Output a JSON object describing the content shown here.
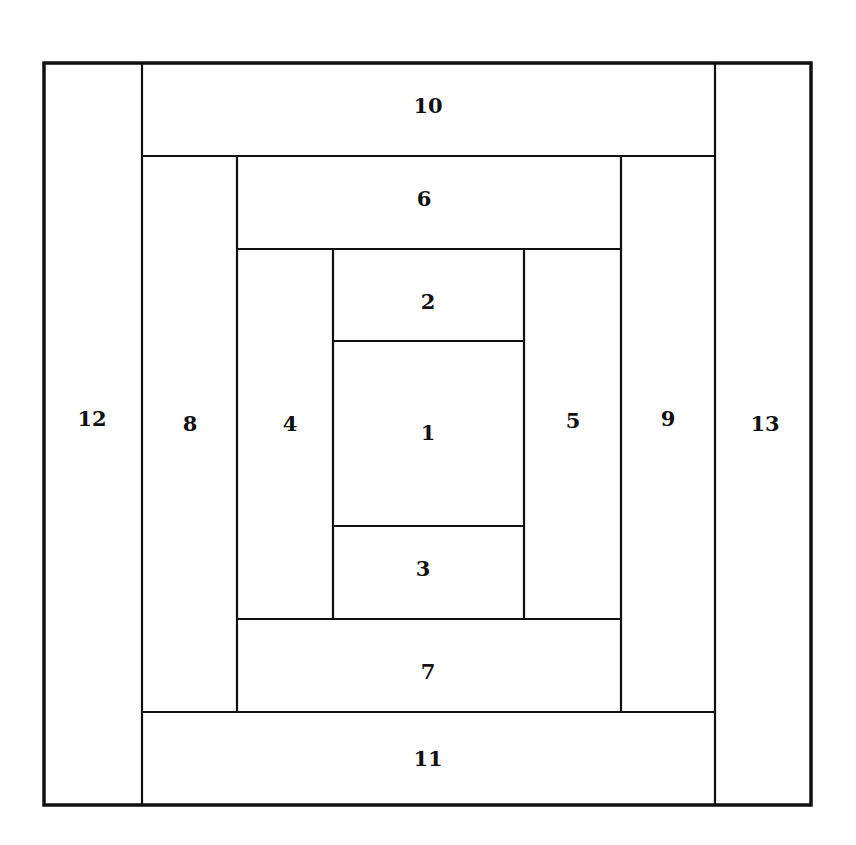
{
  "diagram": {
    "title": "",
    "type": "log-cabin-quilt-block",
    "colors": {
      "line": "#111111",
      "background": "#ffffff"
    },
    "pieces": [
      {
        "label": "1",
        "x": 333,
        "y": 341,
        "w": 191,
        "h": 185,
        "lx": 428,
        "ly": 432
      },
      {
        "label": "2",
        "x": 333,
        "y": 249,
        "w": 191,
        "h": 92,
        "lx": 428,
        "ly": 301
      },
      {
        "label": "3",
        "x": 333,
        "y": 526,
        "w": 191,
        "h": 93,
        "lx": 423,
        "ly": 568
      },
      {
        "label": "4",
        "x": 237,
        "y": 249,
        "w": 96,
        "h": 370,
        "lx": 290,
        "ly": 423
      },
      {
        "label": "5",
        "x": 524,
        "y": 249,
        "w": 97,
        "h": 370,
        "lx": 573,
        "ly": 420
      },
      {
        "label": "6",
        "x": 237,
        "y": 156,
        "w": 384,
        "h": 93,
        "lx": 424,
        "ly": 198
      },
      {
        "label": "7",
        "x": 237,
        "y": 619,
        "w": 384,
        "h": 93,
        "lx": 428,
        "ly": 671
      },
      {
        "label": "8",
        "x": 142,
        "y": 156,
        "w": 95,
        "h": 556,
        "lx": 190,
        "ly": 423
      },
      {
        "label": "9",
        "x": 621,
        "y": 156,
        "w": 94,
        "h": 556,
        "lx": 668,
        "ly": 418
      },
      {
        "label": "10",
        "x": 142,
        "y": 63,
        "w": 573,
        "h": 93,
        "lx": 428,
        "ly": 105
      },
      {
        "label": "11",
        "x": 142,
        "y": 712,
        "w": 573,
        "h": 93,
        "lx": 428,
        "ly": 758
      },
      {
        "label": "12",
        "x": 44,
        "y": 63,
        "w": 98,
        "h": 742,
        "lx": 92,
        "ly": 418
      },
      {
        "label": "13",
        "x": 715,
        "y": 63,
        "w": 96,
        "h": 742,
        "lx": 765,
        "ly": 423
      }
    ]
  }
}
